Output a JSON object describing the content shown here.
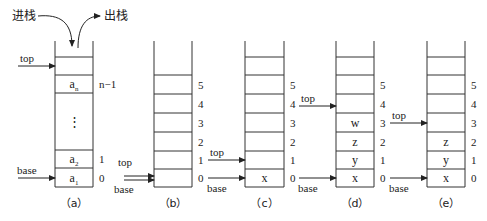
{
  "diagram": {
    "type": "stack-operations",
    "push_label": "进栈",
    "pop_label": "出栈",
    "colors": {
      "line": "#333333",
      "text": "#222222",
      "background": "#ffffff"
    },
    "panels": [
      {
        "id": "a",
        "caption": "（a）",
        "left": 55,
        "right": 93,
        "top_open": 41,
        "lines": [
          57,
          75,
          93,
          150,
          168,
          187
        ],
        "cells": [
          {
            "row_top": 75,
            "row_bottom": 93,
            "value": "a",
            "sub": "n",
            "index": "n−1"
          },
          {
            "row_top": 93,
            "row_bottom": 150,
            "value": "⋮",
            "sub": "",
            "index": ""
          },
          {
            "row_top": 150,
            "row_bottom": 168,
            "value": "a",
            "sub": "2",
            "index": "1"
          },
          {
            "row_top": 168,
            "row_bottom": 187,
            "value": "a",
            "sub": "1",
            "index": "0"
          }
        ],
        "top_pointer": {
          "label": "top",
          "y": 66
        },
        "base_pointer": {
          "label": "base",
          "y": 178
        }
      },
      {
        "id": "b",
        "caption": "（b）",
        "left": 154,
        "right": 192,
        "top_open": 41,
        "lines": [
          75,
          94,
          113,
          132,
          151,
          169,
          187
        ],
        "cells": [
          {
            "row_top": 75,
            "row_bottom": 94,
            "value": "",
            "index": "5"
          },
          {
            "row_top": 94,
            "row_bottom": 113,
            "value": "",
            "index": "4"
          },
          {
            "row_top": 113,
            "row_bottom": 132,
            "value": "",
            "index": "3"
          },
          {
            "row_top": 132,
            "row_bottom": 151,
            "value": "",
            "index": "2"
          },
          {
            "row_top": 151,
            "row_bottom": 169,
            "value": "",
            "index": "1"
          },
          {
            "row_top": 169,
            "row_bottom": 187,
            "value": "",
            "index": "0"
          }
        ],
        "top_pointer": {
          "label": "top",
          "y": 176
        },
        "base_pointer": {
          "label": "base",
          "y": 180
        },
        "combined_pointer": true
      },
      {
        "id": "c",
        "caption": "（c）",
        "left": 245,
        "right": 284,
        "top_open": 41,
        "lines": [
          57,
          75,
          94,
          113,
          132,
          151,
          169,
          187
        ],
        "cells": [
          {
            "row_top": 75,
            "row_bottom": 94,
            "value": "",
            "index": "5"
          },
          {
            "row_top": 94,
            "row_bottom": 113,
            "value": "",
            "index": "4"
          },
          {
            "row_top": 113,
            "row_bottom": 132,
            "value": "",
            "index": "3"
          },
          {
            "row_top": 132,
            "row_bottom": 151,
            "value": "",
            "index": "2"
          },
          {
            "row_top": 151,
            "row_bottom": 169,
            "value": "",
            "index": "1"
          },
          {
            "row_top": 169,
            "row_bottom": 187,
            "value": "x",
            "index": "0"
          }
        ],
        "top_pointer": {
          "label": "top",
          "y": 160
        },
        "base_pointer": {
          "label": "base",
          "y": 178
        }
      },
      {
        "id": "d",
        "caption": "（d）",
        "left": 336,
        "right": 374,
        "top_open": 41,
        "lines": [
          57,
          75,
          94,
          113,
          132,
          151,
          169,
          187
        ],
        "cells": [
          {
            "row_top": 75,
            "row_bottom": 94,
            "value": "",
            "index": "5"
          },
          {
            "row_top": 94,
            "row_bottom": 113,
            "value": "",
            "index": "4"
          },
          {
            "row_top": 113,
            "row_bottom": 132,
            "value": "w",
            "index": "3"
          },
          {
            "row_top": 132,
            "row_bottom": 151,
            "value": "z",
            "index": "2"
          },
          {
            "row_top": 151,
            "row_bottom": 169,
            "value": "y",
            "index": "1"
          },
          {
            "row_top": 169,
            "row_bottom": 187,
            "value": "x",
            "index": "0"
          }
        ],
        "top_pointer": {
          "label": "top",
          "y": 106
        },
        "base_pointer": {
          "label": "base",
          "y": 178
        }
      },
      {
        "id": "e",
        "caption": "（e）",
        "left": 427,
        "right": 465,
        "top_open": 41,
        "lines": [
          57,
          75,
          94,
          113,
          132,
          151,
          169,
          187
        ],
        "cells": [
          {
            "row_top": 75,
            "row_bottom": 94,
            "value": "",
            "index": "5"
          },
          {
            "row_top": 94,
            "row_bottom": 113,
            "value": "",
            "index": "4"
          },
          {
            "row_top": 113,
            "row_bottom": 132,
            "value": "",
            "index": "3"
          },
          {
            "row_top": 132,
            "row_bottom": 151,
            "value": "z",
            "index": "2"
          },
          {
            "row_top": 151,
            "row_bottom": 169,
            "value": "y",
            "index": "1"
          },
          {
            "row_top": 169,
            "row_bottom": 187,
            "value": "x",
            "index": "0"
          }
        ],
        "top_pointer": {
          "label": "top",
          "y": 123
        },
        "base_pointer": {
          "label": "base",
          "y": 178
        }
      }
    ]
  }
}
